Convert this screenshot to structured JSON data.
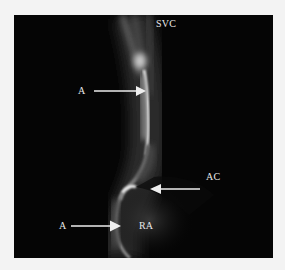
{
  "figure": {
    "background": "#f3f3f3",
    "panel_color": "#050505",
    "labels": [
      {
        "id": "svc",
        "text": "SVC"
      },
      {
        "id": "a-top",
        "text": "A"
      },
      {
        "id": "ac",
        "text": "AC"
      },
      {
        "id": "a-bottom",
        "text": "A"
      },
      {
        "id": "ra",
        "text": "RA"
      }
    ],
    "arrows": [
      {
        "id": "arrow-a-top",
        "direction": "right",
        "points_to": "A"
      },
      {
        "id": "arrow-ac",
        "direction": "left",
        "points_to": "AC"
      },
      {
        "id": "arrow-a-bottom",
        "direction": "right",
        "points_to": "A"
      }
    ]
  }
}
